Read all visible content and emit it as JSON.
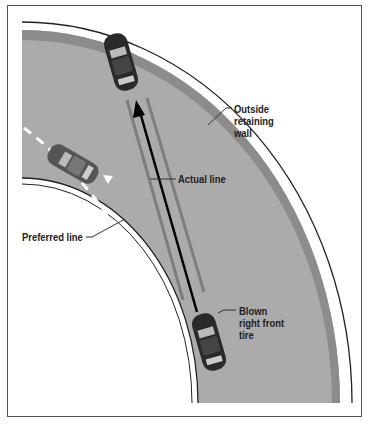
{
  "diagram": {
    "labels": {
      "outside_wall": [
        "Outside",
        "retaining",
        "wall"
      ],
      "actual_line": "Actual line",
      "preferred_line": "Preferred line",
      "blown_tire": [
        "Blown",
        "right front",
        "tire"
      ]
    },
    "colors": {
      "road": "#ababab",
      "shoulder": "#8a8a8a",
      "wall_line": "#222222",
      "car_body": "#2a2a2a",
      "skid_marks": "#7d7d7d",
      "actual_arrow": "#000000",
      "preferred_dash": "#ffffff",
      "frame": "#555555"
    },
    "elements": [
      "outer retaining wall",
      "road surface (curved)",
      "inner road edge",
      "car at wall (after skid)",
      "car on preferred line",
      "car with blown tire",
      "actual line arrow",
      "preferred line dashed arrow",
      "skid marks"
    ]
  }
}
